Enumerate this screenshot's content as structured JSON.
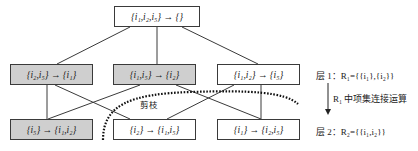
{
  "diagram": {
    "nodes": {
      "root": {
        "label": "{i₁,i₂,i₅} → {}",
        "shaded": false
      },
      "l1a": {
        "label": "{i₂,i₅} → {i₁}",
        "shaded": true
      },
      "l1b": {
        "label": "{i₁,i₅} → {i₂}",
        "shaded": true
      },
      "l1c": {
        "label": "{i₁,i₂} → {i₅}",
        "shaded": false
      },
      "l2a": {
        "label": "{i₅} → {i₁,i₂}",
        "shaded": true
      },
      "l2b": {
        "label": "{i₂} → {i₁,i₅}",
        "shaded": false
      },
      "l2c": {
        "label": "{i₁} → {i₂,i₅}",
        "shaded": false
      }
    },
    "prune_label": "剪枝",
    "layer1_label": "层 1：R₁={{i₁},{i₂}}",
    "arrow_label": "R₁ 中项集连接运算",
    "layer2_label": "层 2：R₂={{i₁,i₂}}",
    "colors": {
      "shaded": "#cfcfcf",
      "line": "#3a3a3a",
      "prune_dots": "#111111"
    }
  }
}
